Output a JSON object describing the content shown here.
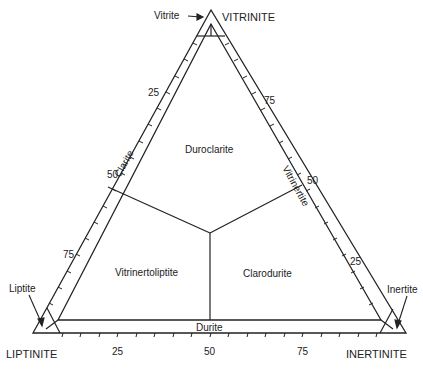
{
  "diagram": {
    "type": "ternary",
    "apices": {
      "top": "VITRINITE",
      "left": "LIPTINITE",
      "right": "INERTINITE"
    },
    "corner_callouts": {
      "top": "Vitrite",
      "left": "Liptite",
      "right": "Inertite"
    },
    "edge_labels": {
      "left": "Clarite",
      "right": "Vitrinertite",
      "bottom": "Durite"
    },
    "regions": {
      "top": "Duroclarite",
      "left": "Vitrinertoliptite",
      "right": "Clarodurite"
    },
    "ticks": {
      "left": [
        "25",
        "50",
        "75"
      ],
      "right": [
        "75",
        "50",
        "25"
      ],
      "bottom": [
        "25",
        "50",
        "75"
      ]
    },
    "line_color": "#222222"
  }
}
